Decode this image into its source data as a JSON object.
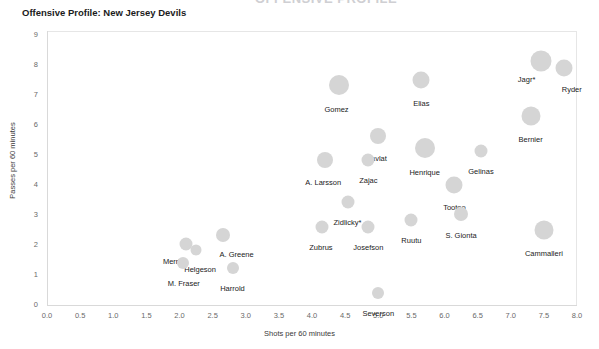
{
  "super_title": "OFFENSIVE PROFILE",
  "chart_data": {
    "type": "scatter",
    "title": "Offensive Profile: New Jersey Devils",
    "xlabel": "Shots per 60 minutes",
    "ylabel": "Passes per 60 minutes",
    "xlim": [
      0.0,
      8.0
    ],
    "ylim": [
      0,
      9
    ],
    "xticks": [
      "0.0",
      "0.5",
      "1.0",
      "1.5",
      "2.0",
      "2.5",
      "3.0",
      "3.5",
      "4.0",
      "4.5",
      "5.0",
      "5.5",
      "6.0",
      "6.5",
      "7.0",
      "7.5",
      "8.0"
    ],
    "yticks": [
      "0",
      "1",
      "2",
      "3",
      "4",
      "5",
      "6",
      "7",
      "8",
      "9"
    ],
    "grid": false,
    "legend": "none",
    "marker_color": "#d5d5d5",
    "points": [
      {
        "label": "Jagr*",
        "x": 7.45,
        "y": 8.15,
        "size": 21,
        "label_dx": -14,
        "label_dy": 14
      },
      {
        "label": "Ryder",
        "x": 7.8,
        "y": 7.9,
        "size": 17,
        "label_dx": 8,
        "label_dy": 17
      },
      {
        "label": "Gomez",
        "x": 4.4,
        "y": 7.35,
        "size": 20,
        "label_dx": -2,
        "label_dy": 20
      },
      {
        "label": "Elias",
        "x": 5.65,
        "y": 7.5,
        "size": 17,
        "label_dx": 0,
        "label_dy": 19
      },
      {
        "label": "Bernier",
        "x": 7.3,
        "y": 6.3,
        "size": 19,
        "label_dx": 0,
        "label_dy": 19
      },
      {
        "label": "Havlat",
        "x": 5.0,
        "y": 5.65,
        "size": 16,
        "label_dx": -2,
        "label_dy": 18
      },
      {
        "label": "Henrique",
        "x": 5.7,
        "y": 5.25,
        "size": 20,
        "label_dx": 0,
        "label_dy": 20
      },
      {
        "label": "Gelinas",
        "x": 6.55,
        "y": 5.15,
        "size": 13,
        "label_dx": 0,
        "label_dy": 16
      },
      {
        "label": "A. Larsson",
        "x": 4.2,
        "y": 4.85,
        "size": 16,
        "label_dx": -2,
        "label_dy": 18
      },
      {
        "label": "Zajac",
        "x": 4.85,
        "y": 4.85,
        "size": 13,
        "label_dx": 0,
        "label_dy": 16
      },
      {
        "label": "Tootoo",
        "x": 6.15,
        "y": 4.0,
        "size": 17,
        "label_dx": 0,
        "label_dy": 18
      },
      {
        "label": "Zidlicky*",
        "x": 4.55,
        "y": 3.45,
        "size": 13,
        "label_dx": -1,
        "label_dy": 16
      },
      {
        "label": "S. Gionta",
        "x": 6.25,
        "y": 3.05,
        "size": 14,
        "label_dx": 0,
        "label_dy": 17
      },
      {
        "label": "Ruutu",
        "x": 5.5,
        "y": 2.85,
        "size": 13,
        "label_dx": 0,
        "label_dy": 16
      },
      {
        "label": "Josefson",
        "x": 4.85,
        "y": 2.6,
        "size": 13,
        "label_dx": 0,
        "label_dy": 16
      },
      {
        "label": "Zubrus",
        "x": 4.15,
        "y": 2.6,
        "size": 13,
        "label_dx": -1,
        "label_dy": 16
      },
      {
        "label": "Cammalleri",
        "x": 7.5,
        "y": 2.5,
        "size": 19,
        "label_dx": 0,
        "label_dy": 19
      },
      {
        "label": "A. Greene",
        "x": 2.65,
        "y": 2.35,
        "size": 14,
        "label_dx": 14,
        "label_dy": 15
      },
      {
        "label": "Merrill",
        "x": 2.1,
        "y": 2.05,
        "size": 13,
        "label_dx": -13,
        "label_dy": 13
      },
      {
        "label": "Helgeson",
        "x": 2.25,
        "y": 1.85,
        "size": 11,
        "label_dx": 4,
        "label_dy": 15
      },
      {
        "label": "M. Fraser",
        "x": 2.05,
        "y": 1.4,
        "size": 12,
        "label_dx": 1,
        "label_dy": 16
      },
      {
        "label": "Harrold",
        "x": 2.8,
        "y": 1.25,
        "size": 12,
        "label_dx": 0,
        "label_dy": 16
      },
      {
        "label": "Severson",
        "x": 5.0,
        "y": 0.4,
        "size": 12,
        "label_dx": 0,
        "label_dy": 16
      }
    ]
  }
}
